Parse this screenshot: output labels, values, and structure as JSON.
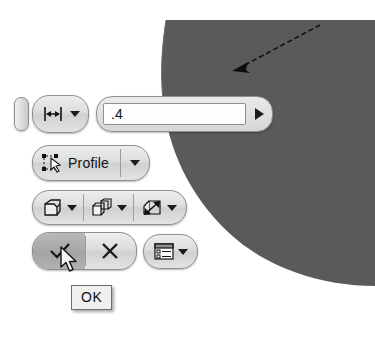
{
  "app": {
    "context": "cad-mini-toolbar",
    "background_color": "#ffffff",
    "model_face_color": "#585858",
    "toolbar_face_color": "#dcdddd",
    "highlight_color": "#a8a9a9"
  },
  "viewport": {
    "model_face_label": "extruded-solid-face",
    "direction_arrow_label": "extrude-direction-arrow"
  },
  "toolbar": {
    "drag_handle_label": "drag-handle",
    "rows": [
      {
        "name": "distance-row",
        "items": [
          {
            "name": "distance-type",
            "icon": "distance-icon",
            "label": "",
            "dropdown": true
          }
        ]
      },
      {
        "name": "profile-row",
        "items": [
          {
            "name": "profile-select",
            "icon": "select-profile-icon",
            "label": "Profile",
            "dropdown": true
          }
        ]
      },
      {
        "name": "options-row",
        "items": [
          {
            "name": "solid-output",
            "icon": "solid-body-icon",
            "label": "",
            "dropdown": true
          },
          {
            "name": "boolean-operation",
            "icon": "boolean-join-icon",
            "label": "",
            "dropdown": true
          },
          {
            "name": "direction-flip",
            "icon": "direction-flip-icon",
            "label": "",
            "dropdown": true
          }
        ]
      },
      {
        "name": "confirm-row",
        "items": [
          {
            "name": "ok",
            "icon": "checkmark-icon",
            "label": "",
            "dropdown": false,
            "hovered": true
          },
          {
            "name": "cancel",
            "icon": "cross-icon",
            "label": "",
            "dropdown": false,
            "hovered": false
          }
        ]
      },
      {
        "name": "more-options-row",
        "items": [
          {
            "name": "more-options",
            "icon": "dialog-options-icon",
            "label": "",
            "dropdown": true
          }
        ]
      }
    ]
  },
  "value_field": {
    "name": "distance-value",
    "value": ".4",
    "placeholder": "",
    "expand_icon": "expand-arrow-icon"
  },
  "tooltip": {
    "name": "ok-tooltip",
    "text": "OK"
  },
  "cursor": {
    "name": "mouse-pointer",
    "x": 68,
    "y": 252
  }
}
